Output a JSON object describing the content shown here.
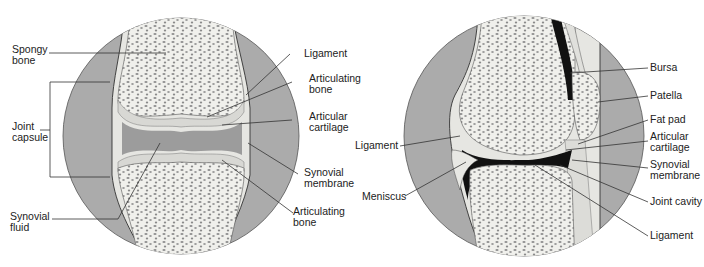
{
  "left_diagram": {
    "title": "Synovial joint (frontal section)",
    "labels": {
      "spongy_bone": "Spongy\nbone",
      "joint_capsule": "Joint\ncapsule",
      "synovial_fluid": "Synovial\nfluid",
      "ligament": "Ligament",
      "articulating_bone_top": "Articulating\nbone",
      "articular_cartilage": "Articular\ncartilage",
      "synovial_membrane": "Synovial\nmembrane",
      "articulating_bone_bottom": "Articulating\nbone"
    }
  },
  "right_diagram": {
    "title": "Knee joint (sagittal section)",
    "labels": {
      "ligament_left": "Ligament",
      "meniscus": "Meniscus",
      "bursa": "Bursa",
      "patella": "Patella",
      "fat_pad": "Fat pad",
      "articular_cartilage": "Articular\ncartilage",
      "synovial_membrane": "Synovial\nmembrane",
      "joint_cavity": "Joint cavity",
      "ligament_bottom": "Ligament"
    }
  },
  "colors": {
    "background": "#ffffff",
    "circle_fill": "#a9a9a9",
    "bone_fill": "#eeeeea",
    "spongy_dots": "#8c8c8c",
    "cartilage": "#d9d9d6",
    "cavity_dark": "#111111",
    "line": "#333333"
  }
}
